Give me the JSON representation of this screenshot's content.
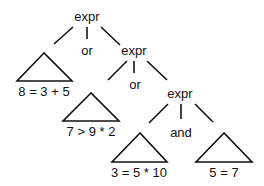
{
  "diagram": {
    "type": "parse-tree",
    "colors": {
      "ink": "#111111",
      "background": "#ffffff"
    },
    "nodes": {
      "root": {
        "label": "expr"
      },
      "or1": {
        "label": "or"
      },
      "expr2": {
        "label": "expr"
      },
      "or2": {
        "label": "or"
      },
      "expr3": {
        "label": "expr"
      },
      "and1": {
        "label": "and"
      }
    },
    "subtrees": [
      {
        "id": "t1",
        "label": "8 = 3 + 5"
      },
      {
        "id": "t2",
        "label": "7 > 9 * 2"
      },
      {
        "id": "t3",
        "label": "3 = 5 * 10"
      },
      {
        "id": "t4",
        "label": "5 = 7"
      }
    ],
    "edges": [
      [
        "root",
        "t1"
      ],
      [
        "root",
        "or1"
      ],
      [
        "root",
        "expr2"
      ],
      [
        "expr2",
        "t2"
      ],
      [
        "expr2",
        "or2"
      ],
      [
        "expr2",
        "expr3"
      ],
      [
        "expr3",
        "t3"
      ],
      [
        "expr3",
        "and1"
      ],
      [
        "expr3",
        "t4"
      ]
    ]
  }
}
